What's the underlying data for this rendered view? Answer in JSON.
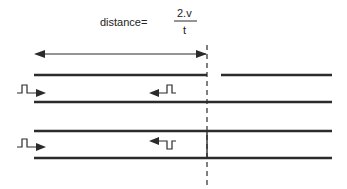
{
  "formula": {
    "label": "distance=",
    "numerator": "2.v",
    "denominator": "t"
  },
  "colors": {
    "line": "#2b2b2b",
    "background": "#ffffff"
  },
  "cables": [
    {
      "name": "faulted-cable",
      "fault_type": "open-circuit",
      "reflected_pulse": "positive"
    },
    {
      "name": "shorted-cable",
      "fault_type": "short-circuit",
      "reflected_pulse": "negative"
    }
  ]
}
